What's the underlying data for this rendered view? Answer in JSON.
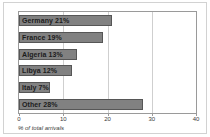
{
  "chart_data": {
    "type": "bar",
    "orientation": "horizontal",
    "title": "",
    "subtitle": "",
    "xlabel": "% of total arrivals",
    "ylabel": "",
    "xlim": [
      0,
      40
    ],
    "xticks": [
      0,
      10,
      20,
      30,
      40
    ],
    "xtick_labels": [
      "0",
      "10",
      "20",
      "30",
      "40"
    ],
    "grid": true,
    "grid_axis": "x",
    "legend": false,
    "legend_position": "none",
    "bar_color": "#818181",
    "bar_edge_color": "#565656",
    "label_color": "#1c1c1c",
    "categories": [
      "Germany",
      "France",
      "Algeria",
      "Libya",
      "Italy",
      "Other"
    ],
    "values": [
      21,
      19,
      13,
      12,
      7,
      28
    ],
    "bar_labels": [
      "Germany 21%",
      "France 19%",
      "Algeria 13%",
      "Libya 12%",
      "Italy 7%",
      "Other 28%"
    ]
  }
}
